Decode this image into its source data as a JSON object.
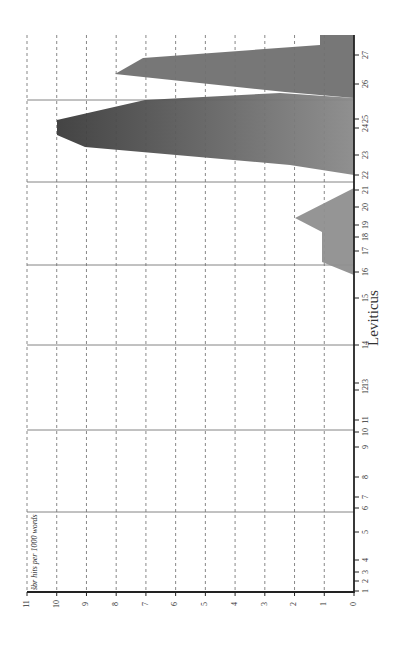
{
  "chart_data": {
    "type": "area",
    "orientation": "rotated-90-clockwise",
    "title": "",
    "xlabel": "Leviticus",
    "ylabel": "šbr hits per 1000 words",
    "ylim": [
      0,
      11
    ],
    "y_ticks": [
      0,
      1,
      2,
      3,
      4,
      5,
      6,
      7,
      8,
      9,
      10,
      11
    ],
    "grid": {
      "horizontal_dashed": true,
      "chapter_dividers_solid": [
        6,
        10,
        14,
        17,
        22,
        26
      ]
    },
    "x_ticks": [
      {
        "label": "1",
        "pos": 591
      },
      {
        "label": "2",
        "pos": 581
      },
      {
        "label": "3",
        "pos": 572
      },
      {
        "label": "4",
        "pos": 560
      },
      {
        "label": "5",
        "pos": 532
      },
      {
        "label": "6",
        "pos": 508
      },
      {
        "label": "7",
        "pos": 497
      },
      {
        "label": "8",
        "pos": 477
      },
      {
        "label": "9",
        "pos": 447
      },
      {
        "label": "10",
        "pos": 432
      },
      {
        "label": "11",
        "pos": 420
      },
      {
        "label": "12",
        "pos": 390
      },
      {
        "label": "13",
        "pos": 383
      },
      {
        "label": "14",
        "pos": 345
      },
      {
        "label": "15",
        "pos": 298
      },
      {
        "label": "16",
        "pos": 272
      },
      {
        "label": "17",
        "pos": 251
      },
      {
        "label": "18",
        "pos": 237
      },
      {
        "label": "19",
        "pos": 225
      },
      {
        "label": "20",
        "pos": 207
      },
      {
        "label": "21",
        "pos": 190
      },
      {
        "label": "22",
        "pos": 175
      },
      {
        "label": "23",
        "pos": 155
      },
      {
        "label": "24",
        "pos": 128
      },
      {
        "label": "25",
        "pos": 119
      },
      {
        "label": "26",
        "pos": 84
      },
      {
        "label": "27",
        "pos": 55
      }
    ],
    "solid_divider_positions": [
      100,
      182,
      265,
      345,
      430,
      512
    ],
    "series": [
      {
        "name": "shaded region chapters 16.5-21",
        "color": "#8a8a8a",
        "points_chapter_value": [
          {
            "chapter": 21.0,
            "value": 0.0
          },
          {
            "chapter": 19.5,
            "value": 2.0
          },
          {
            "chapter": 18.8,
            "value": 1.1
          },
          {
            "chapter": 17.0,
            "value": 1.1
          },
          {
            "chapter": 16.5,
            "value": 0.0
          }
        ]
      },
      {
        "name": "main peak chapters 22-26",
        "color": "#4a4a4a",
        "points_chapter_value": [
          {
            "chapter": 22.0,
            "value": 0.0
          },
          {
            "chapter": 22.4,
            "value": 2.2
          },
          {
            "chapter": 23.3,
            "value": 9.2
          },
          {
            "chapter": 24.0,
            "value": 10.2
          },
          {
            "chapter": 24.7,
            "value": 10.2
          },
          {
            "chapter": 25.5,
            "value": 7.0
          },
          {
            "chapter": 26.0,
            "value": 2.5
          }
        ]
      },
      {
        "name": "second peak chapters 26-27",
        "color": "#6a6a6a",
        "points_chapter_value": [
          {
            "chapter": 26.1,
            "value": 2.4
          },
          {
            "chapter": 26.6,
            "value": 8.2
          },
          {
            "chapter": 27.0,
            "value": 7.2
          },
          {
            "chapter": 27.6,
            "value": 1.2
          },
          {
            "chapter": 27.6,
            "value": 0.0
          }
        ]
      }
    ],
    "polygons_px": [
      {
        "fill": "#8f8f8f",
        "points": "354,188 295,218 322,232 322,262 354,275"
      },
      {
        "fill": "#555555",
        "points": "354,175 290,165 85,147 57,135 57,120 145,100 280,93 354,98"
      },
      {
        "fill": "#707070",
        "points": "354,98 285,92 115,74 143,58 320,45 320,35 354,35"
      }
    ]
  }
}
